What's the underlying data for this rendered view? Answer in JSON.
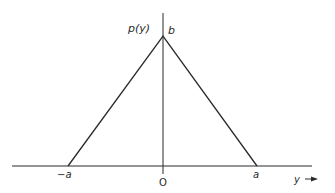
{
  "diagram": {
    "type": "triangular probability density function",
    "y_axis_label": "p(y)",
    "x_axis_label": "y",
    "peak_label": "b",
    "left_limit_label": "−a",
    "right_limit_label": "a",
    "origin_label": "O",
    "colors": {
      "line": "#2a2a2a",
      "background": "#ffffff"
    }
  }
}
